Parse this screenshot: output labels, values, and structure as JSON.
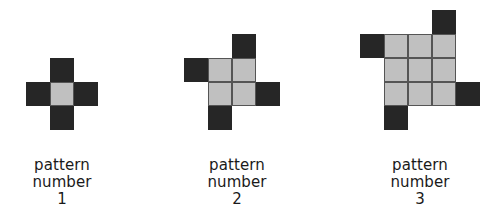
{
  "figure": {
    "background_color": "#ffffff",
    "dark_color": "#262626",
    "gray_color": "#c0c0c0",
    "gridline_color": "#555555",
    "text_color": "#1a1a1a",
    "cell_size": 24
  },
  "patterns": [
    {
      "id": "pattern-1",
      "label_line1": "pattern",
      "label_line2": "number",
      "label_line3": "1",
      "number": 1,
      "grid_columns": 3,
      "grid_rows": 3,
      "gray_block": "1x1",
      "gray_count": 1,
      "dark_count": 4,
      "total_squares": 5,
      "origin_x": 26,
      "origin_y": 58,
      "label_x": -18,
      "label_y": 157,
      "cells": [
        {
          "col": 1,
          "row": 0,
          "color": "dark"
        },
        {
          "col": 0,
          "row": 1,
          "color": "dark"
        },
        {
          "col": 1,
          "row": 1,
          "color": "gray"
        },
        {
          "col": 2,
          "row": 1,
          "color": "dark"
        },
        {
          "col": 1,
          "row": 2,
          "color": "dark"
        }
      ]
    },
    {
      "id": "pattern-2",
      "label_line1": "pattern",
      "label_line2": "number",
      "label_line3": "2",
      "number": 2,
      "grid_columns": 4,
      "grid_rows": 4,
      "gray_block": "2x2",
      "gray_count": 4,
      "dark_count": 4,
      "total_squares": 8,
      "origin_x": 184,
      "origin_y": 34,
      "label_x": 157,
      "label_y": 157,
      "cells": [
        {
          "col": 2,
          "row": 0,
          "color": "dark"
        },
        {
          "col": 0,
          "row": 1,
          "color": "dark"
        },
        {
          "col": 1,
          "row": 1,
          "color": "gray"
        },
        {
          "col": 2,
          "row": 1,
          "color": "gray"
        },
        {
          "col": 1,
          "row": 2,
          "color": "gray"
        },
        {
          "col": 2,
          "row": 2,
          "color": "gray"
        },
        {
          "col": 3,
          "row": 2,
          "color": "dark"
        },
        {
          "col": 1,
          "row": 3,
          "color": "dark"
        }
      ]
    },
    {
      "id": "pattern-3",
      "label_line1": "pattern",
      "label_line2": "number",
      "label_line3": "3",
      "number": 3,
      "grid_columns": 5,
      "grid_rows": 5,
      "gray_block": "3x3",
      "gray_count": 9,
      "dark_count": 4,
      "total_squares": 13,
      "origin_x": 360,
      "origin_y": 10,
      "label_x": 340,
      "label_y": 157,
      "cells": [
        {
          "col": 3,
          "row": 0,
          "color": "dark"
        },
        {
          "col": 0,
          "row": 1,
          "color": "dark"
        },
        {
          "col": 1,
          "row": 1,
          "color": "gray"
        },
        {
          "col": 2,
          "row": 1,
          "color": "gray"
        },
        {
          "col": 3,
          "row": 1,
          "color": "gray"
        },
        {
          "col": 1,
          "row": 2,
          "color": "gray"
        },
        {
          "col": 2,
          "row": 2,
          "color": "gray"
        },
        {
          "col": 3,
          "row": 2,
          "color": "gray"
        },
        {
          "col": 1,
          "row": 3,
          "color": "gray"
        },
        {
          "col": 2,
          "row": 3,
          "color": "gray"
        },
        {
          "col": 3,
          "row": 3,
          "color": "gray"
        },
        {
          "col": 4,
          "row": 3,
          "color": "dark"
        },
        {
          "col": 1,
          "row": 4,
          "color": "dark"
        }
      ]
    }
  ]
}
